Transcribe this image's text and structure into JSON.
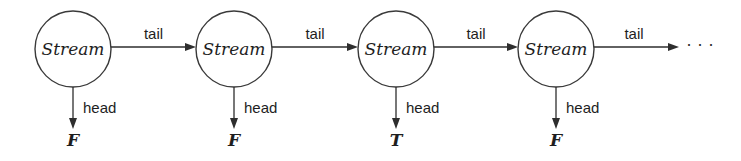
{
  "diagram": {
    "type": "stream-chain",
    "nodes": [
      {
        "label": "Stream",
        "head_value": "F"
      },
      {
        "label": "Stream",
        "head_value": "F"
      },
      {
        "label": "Stream",
        "head_value": "T"
      },
      {
        "label": "Stream",
        "head_value": "F"
      }
    ],
    "edges": {
      "tail_label": "tail",
      "head_label": "head"
    },
    "continuation": "· · ·",
    "colors": {
      "stroke": "#2e2e2e",
      "background": "#ffffff"
    }
  }
}
